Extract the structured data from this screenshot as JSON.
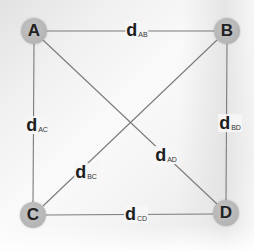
{
  "diagram": {
    "type": "complete-graph",
    "line_color": "#7a7a7a",
    "node_color": "#b8b8b8",
    "nodes": [
      {
        "id": "A",
        "label": "A",
        "x": 34,
        "y": 31
      },
      {
        "id": "B",
        "label": "B",
        "x": 227,
        "y": 31
      },
      {
        "id": "C",
        "label": "C",
        "x": 33,
        "y": 215
      },
      {
        "id": "D",
        "label": "D",
        "x": 226,
        "y": 213
      }
    ],
    "edges": [
      {
        "id": "AB",
        "from": "A",
        "to": "B",
        "symbol": "d",
        "subscript": "AB",
        "label_x": 137,
        "label_y": 31
      },
      {
        "id": "AC",
        "from": "A",
        "to": "C",
        "symbol": "d",
        "subscript": "AC",
        "label_x": 37,
        "label_y": 126
      },
      {
        "id": "BD",
        "from": "B",
        "to": "D",
        "symbol": "d",
        "subscript": "BD",
        "label_x": 228,
        "label_y": 124
      },
      {
        "id": "BC",
        "from": "B",
        "to": "C",
        "symbol": "d",
        "subscript": "BC",
        "label_x": 84,
        "label_y": 173
      },
      {
        "id": "AD",
        "from": "A",
        "to": "D",
        "symbol": "d",
        "subscript": "AD",
        "label_x": 164,
        "label_y": 156
      },
      {
        "id": "CD",
        "from": "C",
        "to": "D",
        "symbol": "d",
        "subscript": "CD",
        "label_x": 134,
        "label_y": 215
      }
    ]
  }
}
